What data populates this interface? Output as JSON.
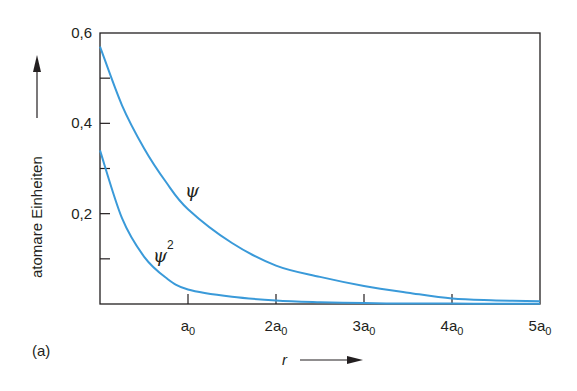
{
  "chart_data": {
    "type": "line",
    "title": "",
    "panel_label": "(a)",
    "xlabel": "r",
    "ylabel": "atomare Einheiten",
    "xlim": [
      0,
      5
    ],
    "ylim": [
      0,
      0.6
    ],
    "x_unit": "a0",
    "grid": false,
    "legend": "inline labels",
    "x_ticks": [
      {
        "value": 1,
        "label": "a",
        "sub": "0"
      },
      {
        "value": 2,
        "label": "2a",
        "sub": "0"
      },
      {
        "value": 3,
        "label": "3a",
        "sub": "0"
      },
      {
        "value": 4,
        "label": "4a",
        "sub": "0"
      },
      {
        "value": 5,
        "label": "5a",
        "sub": "0"
      }
    ],
    "y_ticks": [
      {
        "value": 0.1,
        "label": ""
      },
      {
        "value": 0.2,
        "label": "0,2"
      },
      {
        "value": 0.3,
        "label": ""
      },
      {
        "value": 0.4,
        "label": "0,4"
      },
      {
        "value": 0.5,
        "label": ""
      },
      {
        "value": 0.6,
        "label": "0,6"
      }
    ],
    "x": [
      0,
      0.25,
      0.5,
      0.75,
      1,
      1.5,
      2,
      2.5,
      3,
      3.5,
      4,
      4.5,
      5
    ],
    "series": [
      {
        "name": "ψ",
        "label": "ψ",
        "color": "#3a9ad9",
        "values": [
          0.57,
          0.44,
          0.345,
          0.27,
          0.21,
          0.135,
          0.085,
          0.06,
          0.04,
          0.025,
          0.012,
          0.008,
          0.006
        ]
      },
      {
        "name": "ψ²",
        "label": "ψ",
        "superscript": "2",
        "color": "#3a9ad9",
        "values": [
          0.34,
          0.19,
          0.105,
          0.058,
          0.032,
          0.016,
          0.008,
          0.004,
          0.002,
          0.001,
          0.001,
          0.0005,
          0.0005
        ]
      }
    ]
  }
}
